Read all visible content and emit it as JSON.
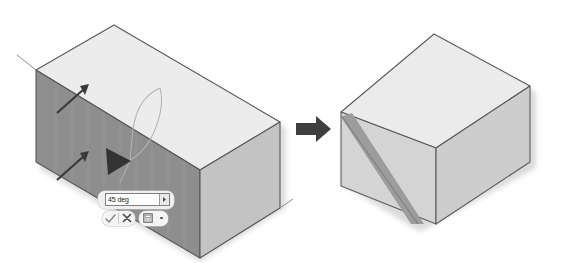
{
  "illustration": {
    "title": "Draft angle feature illustration",
    "description": "Isometric box with a selected face being drafted at an angle, producing a tapered result",
    "before_label": "before",
    "after_label": "after"
  },
  "value_editor": {
    "value": "45 deg",
    "placeholder": "45 deg",
    "spinner_icon": "chevron-right-icon",
    "accept_label": "OK",
    "accept_icon": "check-icon",
    "cancel_label": "Cancel",
    "cancel_icon": "close-icon",
    "options_label": "More options",
    "options_icon": "calculator-icon",
    "dropdown_icon": "dropdown-dot-icon"
  },
  "flow": {
    "arrow_icon": "arrow-right-icon",
    "arrow_color": "#3f3f3f"
  },
  "colors": {
    "face_selected": "#8e8e8e",
    "face_side": "#c3c3c3",
    "face_top": "#ececec",
    "face_top_right": "#e6e6e6",
    "face_front_right": "#d8d8d8",
    "face_side_right": "#c9c9c9",
    "chamfer": "#9a9a9a",
    "edge": "#565656",
    "shadow": "#cfcfcf",
    "annotation": "#3a3a3a",
    "arc": "#b0b0b0"
  },
  "annotations": {
    "direction_arrow_1": "direction-arrow-upper",
    "direction_arrow_2": "direction-arrow-lower",
    "rotation_arc": "rotation-arc",
    "drag_handle": "triangle-drag-handle",
    "extension_line_top": "extension-line-top-left",
    "extension_line_bottom": "extension-line-bottom-right"
  }
}
